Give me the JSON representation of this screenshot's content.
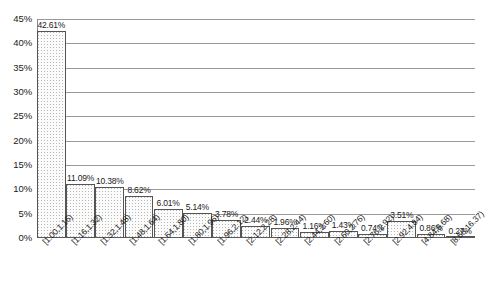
{
  "chart_data": {
    "type": "bar",
    "title": "",
    "subtitle": "",
    "xlabel": "",
    "ylabel": "",
    "ylim": [
      0,
      45
    ],
    "ytick_labels": [
      "0%",
      "5%",
      "10%",
      "15%",
      "20%",
      "25%",
      "30%",
      "35%",
      "40%",
      "45%"
    ],
    "ytick_values": [
      0,
      5,
      10,
      15,
      20,
      25,
      30,
      35,
      40,
      45
    ],
    "grid": true,
    "legend": false,
    "legend_position": "none",
    "categories": [
      "[1.00,1.16)",
      "[1.16,1.32)",
      "[1.32,1.48)",
      "[1.48,1.64)",
      "[1.64,1.80)",
      "[1.80,1.96)",
      "[1.96,2.12)",
      "[2.12,2.28)",
      "[2.28,2.44)",
      "[2.44,2.60)",
      "[2.60,2.76)",
      "[2.76,2.92)",
      "[2.92,4.84)",
      "[4.84,8.68)",
      "[8.68,16.37)"
    ],
    "values": [
      42.61,
      11.09,
      10.38,
      8.62,
      6.01,
      5.14,
      3.78,
      2.44,
      1.96,
      1.16,
      1.43,
      0.74,
      3.51,
      0.86,
      0.27
    ],
    "data_labels": [
      "42.61%",
      "11.09%",
      "10.38%",
      "8.62%",
      "6.01%",
      "5.14%",
      "3.78%",
      "2.44%",
      "1.96%",
      "1.16%",
      "1.43%",
      "0.74%",
      "3.51%",
      "0.86%",
      "0.27%"
    ]
  },
  "style": {
    "bar_border_color": "#555555",
    "bar_fill_color": "#fbfbfb",
    "grid_color": "#9a9a9a",
    "axis_color": "#5a5a5a",
    "text_color": "#1a1a1a",
    "background_color": "#ffffff"
  }
}
